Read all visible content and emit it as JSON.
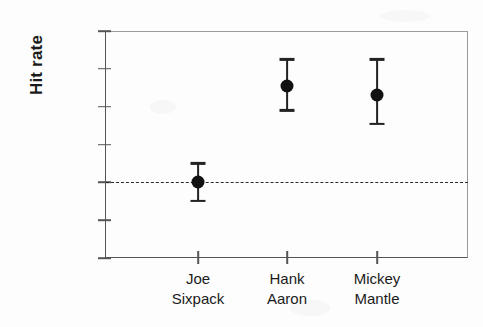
{
  "chart_data": {
    "type": "scatter",
    "title": "",
    "xlabel": "",
    "ylabel": "Hit rate",
    "ylim": [
      21,
      33
    ],
    "ytick_values": [
      21,
      23,
      25,
      27,
      29,
      31,
      33
    ],
    "ytick_labels": [
      "21%",
      "23%",
      "25%",
      "27%",
      "29%",
      "31%",
      "33%"
    ],
    "grid": false,
    "legend": "none",
    "reference_line": {
      "value": 25,
      "label": "25%",
      "style": "dashed"
    },
    "categories": [
      {
        "line1": "Joe",
        "line2": "Sixpack"
      },
      {
        "line1": "Hank",
        "line2": "Aaron"
      },
      {
        "line1": "Mickey",
        "line2": "Mantle"
      }
    ],
    "series": [
      {
        "name": "Hit rate",
        "values": [
          25.0,
          30.1,
          29.6
        ],
        "error_low": [
          24.0,
          28.8,
          28.1
        ],
        "error_high": [
          26.0,
          31.5,
          31.5
        ]
      }
    ],
    "colors": {
      "marker": "#111111",
      "error_bar": "#232323",
      "axis": "#555555",
      "reference_line": "#2a2a2a",
      "text": "#1b1b1b",
      "background": "#fdfdfd"
    }
  }
}
